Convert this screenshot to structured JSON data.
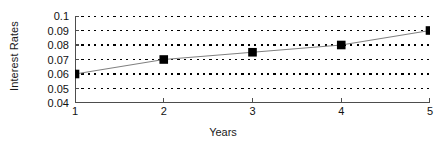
{
  "chart_data": {
    "type": "line",
    "title": "",
    "xlabel": "Years",
    "ylabel": "Interest Rates",
    "x": [
      1,
      2,
      3,
      4,
      5
    ],
    "values": [
      0.06,
      0.07,
      0.075,
      0.08,
      0.09
    ],
    "series": [
      {
        "name": "Interest Rates",
        "values": [
          0.06,
          0.07,
          0.075,
          0.08,
          0.09
        ],
        "marker": "filled-square",
        "marker_color": "#000000",
        "line_color": "#808080"
      }
    ],
    "xlim": [
      1,
      5
    ],
    "ylim": [
      0.04,
      0.1
    ],
    "xticks": [
      1,
      2,
      3,
      4,
      5
    ],
    "xtick_labels": [
      "1",
      "2",
      "3",
      "4",
      "5"
    ],
    "yticks": [
      0.04,
      0.05,
      0.06,
      0.07,
      0.08,
      0.09,
      0.1
    ],
    "ytick_labels": [
      "0.04",
      "0.05",
      "0.06",
      "0.07",
      "0.08",
      "0.09",
      "0.1"
    ],
    "grid": "horizontal-dashed",
    "grid_color": "#000000",
    "axis_color": "#4d4d4d",
    "legend": "none",
    "background": "#ffffff"
  }
}
